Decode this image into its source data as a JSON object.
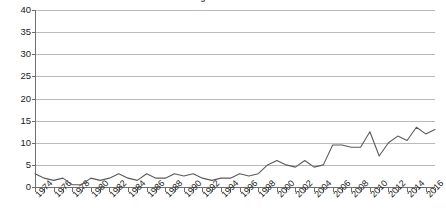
{
  "chart_data": {
    "type": "line",
    "title": "Management School",
    "xlabel": "",
    "ylabel": "",
    "ylim": [
      0,
      40
    ],
    "ytick_step": 5,
    "yticks": [
      0,
      5,
      10,
      15,
      20,
      25,
      30,
      35,
      40
    ],
    "grid": true,
    "legend": "none",
    "xlim": [
      1974,
      2017
    ],
    "xtick_step": 2,
    "xtick_labels": [
      "1974",
      "1976",
      "1978",
      "1980",
      "1982",
      "1984",
      "1986",
      "1988",
      "1990",
      "1992",
      "1994",
      "1996",
      "1998",
      "2000",
      "2002",
      "2004",
      "2006",
      "2008",
      "2010",
      "2012",
      "2014",
      "2016"
    ],
    "x": [
      1974,
      1975,
      1976,
      1977,
      1978,
      1979,
      1980,
      1981,
      1982,
      1983,
      1984,
      1985,
      1986,
      1987,
      1988,
      1989,
      1990,
      1991,
      1992,
      1993,
      1994,
      1995,
      1996,
      1997,
      1998,
      1999,
      2000,
      2001,
      2002,
      2003,
      2004,
      2005,
      2006,
      2007,
      2008,
      2009,
      2010,
      2011,
      2012,
      2013,
      2014,
      2015,
      2016,
      2017
    ],
    "values": [
      3,
      2,
      1.5,
      2,
      0.5,
      0.5,
      2,
      1.5,
      2,
      3,
      2,
      1.5,
      3,
      2,
      2,
      3,
      2.5,
      3,
      2,
      1.5,
      2,
      2,
      3,
      2.5,
      3,
      5,
      6,
      5,
      4.5,
      6,
      4.5,
      5,
      9.5,
      9.5,
      9,
      9,
      12.5,
      7,
      10,
      11.5,
      10.5,
      13.5,
      12,
      13
    ],
    "series": [
      {
        "name": "publications",
        "values": [
          3,
          2,
          1.5,
          2,
          0.5,
          0.5,
          2,
          1.5,
          2,
          3,
          2,
          1.5,
          3,
          2,
          2,
          3,
          2.5,
          3,
          2,
          1.5,
          2,
          2,
          3,
          2.5,
          3,
          5,
          6,
          5,
          4.5,
          6,
          4.5,
          5,
          9.5,
          9.5,
          9,
          9,
          12.5,
          7,
          10,
          11.5,
          10.5,
          13.5,
          12,
          13
        ]
      }
    ],
    "line_color": "#5a5a5a",
    "grid_color": "#b9b9b9",
    "axis_color": "#6e6e6e",
    "points": [
      {
        "year": 1974,
        "value": 3
      },
      {
        "year": 1975,
        "value": 2
      },
      {
        "year": 1976,
        "value": 1.5
      },
      {
        "year": 1977,
        "value": 2
      },
      {
        "year": 1978,
        "value": 0.5
      },
      {
        "year": 1979,
        "value": 0.5
      },
      {
        "year": 1980,
        "value": 2
      },
      {
        "year": 1981,
        "value": 1.5
      },
      {
        "year": 1982,
        "value": 2
      },
      {
        "year": 1983,
        "value": 3
      },
      {
        "year": 1984,
        "value": 2
      },
      {
        "year": 1985,
        "value": 1.5
      },
      {
        "year": 1986,
        "value": 3
      },
      {
        "year": 1987,
        "value": 2
      },
      {
        "year": 1988,
        "value": 2
      },
      {
        "year": 1989,
        "value": 3
      },
      {
        "year": 1990,
        "value": 2.5
      },
      {
        "year": 1991,
        "value": 3
      },
      {
        "year": 1992,
        "value": 2
      },
      {
        "year": 1993,
        "value": 1.5
      },
      {
        "year": 1994,
        "value": 2
      },
      {
        "year": 1995,
        "value": 2
      },
      {
        "year": 1996,
        "value": 3
      },
      {
        "year": 1997,
        "value": 2.5
      },
      {
        "year": 1998,
        "value": 3
      },
      {
        "year": 1999,
        "value": 5
      },
      {
        "year": 2000,
        "value": 6
      },
      {
        "year": 2001,
        "value": 5
      },
      {
        "year": 2002,
        "value": 4.5
      },
      {
        "year": 2003,
        "value": 6
      },
      {
        "year": 2004,
        "value": 4.5
      },
      {
        "year": 2005,
        "value": 5
      },
      {
        "year": 2006,
        "value": 9.5
      },
      {
        "year": 2007,
        "value": 9.5
      },
      {
        "year": 2008,
        "value": 9
      },
      {
        "year": 2009,
        "value": 9
      },
      {
        "year": 2010,
        "value": 12.5
      },
      {
        "year": 2011,
        "value": 7
      },
      {
        "year": 2012,
        "value": 10
      },
      {
        "year": 2013,
        "value": 11.5
      },
      {
        "year": 2014,
        "value": 10.5
      },
      {
        "year": 2015,
        "value": 13.5
      },
      {
        "year": 2016,
        "value": 12
      },
      {
        "year": 2017,
        "value": 13
      }
    ]
  },
  "chart_render": {
    "comment_not_displayed": null
  }
}
